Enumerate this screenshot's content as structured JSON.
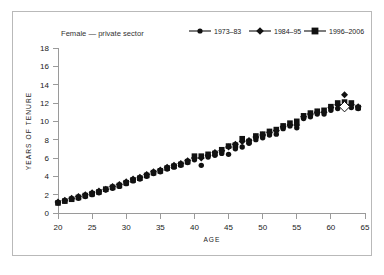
{
  "figure": {
    "series_title": "Female — private sector",
    "background": "#ffffff",
    "frame_color": "#b9b9b9",
    "ink_color": "#111111"
  },
  "legend": {
    "position": "top-right",
    "entries": [
      {
        "label": "1973–83",
        "marker": "circle-marker",
        "color": "#111111"
      },
      {
        "label": "1984–95",
        "marker": "diamond-marker",
        "color": "#111111"
      },
      {
        "label": "1996–2006",
        "marker": "square-marker",
        "color": "#111111"
      }
    ]
  },
  "chart_data": {
    "type": "scatter",
    "title": "Female — private sector",
    "xlabel": "AGE",
    "ylabel": "YEARS OF TENURE",
    "xlim": [
      20,
      65
    ],
    "ylim": [
      0,
      18
    ],
    "xticks": [
      20,
      25,
      30,
      35,
      40,
      45,
      50,
      55,
      60,
      65
    ],
    "yticks": [
      0,
      2,
      4,
      6,
      8,
      10,
      12,
      14,
      16,
      18
    ],
    "grid": false,
    "legend_position": "top-right",
    "x": [
      20,
      21,
      22,
      23,
      24,
      25,
      26,
      27,
      28,
      29,
      30,
      31,
      32,
      33,
      34,
      35,
      36,
      37,
      38,
      39,
      40,
      41,
      42,
      43,
      44,
      45,
      46,
      47,
      48,
      49,
      50,
      51,
      52,
      53,
      54,
      55,
      56,
      57,
      58,
      59,
      60,
      61,
      62,
      63,
      64
    ],
    "series": [
      {
        "name": "1973–83",
        "marker": "circle-marker",
        "values": [
          1.1,
          1.3,
          1.5,
          1.6,
          1.8,
          2.0,
          2.2,
          2.5,
          2.7,
          2.9,
          3.2,
          3.5,
          3.7,
          4.0,
          4.3,
          4.5,
          4.8,
          5.0,
          5.2,
          5.5,
          5.8,
          5.2,
          6.1,
          6.3,
          6.5,
          6.4,
          7.0,
          7.2,
          7.6,
          8.0,
          8.2,
          8.5,
          8.6,
          9.2,
          9.5,
          9.3,
          10.3,
          10.5,
          10.8,
          10.8,
          11.2,
          11.4,
          11.6,
          11.5,
          11.4
        ]
      },
      {
        "name": "1984–95",
        "marker": "diamond-marker",
        "values": [
          1.2,
          1.4,
          1.6,
          1.8,
          2.0,
          2.2,
          2.4,
          2.6,
          2.9,
          3.1,
          3.4,
          3.7,
          3.9,
          4.2,
          4.5,
          4.7,
          5.0,
          5.2,
          5.4,
          5.7,
          6.0,
          6.0,
          6.3,
          6.6,
          6.8,
          7.2,
          7.5,
          7.8,
          7.9,
          8.3,
          8.5,
          8.8,
          9.0,
          9.4,
          9.6,
          9.6,
          10.5,
          10.8,
          11.0,
          11.0,
          11.5,
          11.8,
          12.9,
          11.8,
          11.6
        ]
      },
      {
        "name": "1996–2006",
        "marker": "square-marker",
        "values": [
          1.1,
          1.3,
          1.5,
          1.7,
          1.9,
          2.1,
          2.3,
          2.6,
          2.8,
          3.0,
          3.3,
          3.6,
          3.8,
          4.1,
          4.4,
          4.6,
          4.9,
          5.1,
          5.3,
          5.6,
          6.2,
          6.2,
          6.4,
          6.5,
          6.9,
          7.3,
          7.4,
          8.1,
          7.8,
          8.4,
          8.6,
          8.9,
          9.1,
          9.5,
          9.8,
          10.0,
          10.6,
          10.9,
          11.1,
          11.2,
          11.6,
          12.0,
          12.1,
          12.0,
          11.5
        ]
      }
    ],
    "annotations": [
      {
        "type": "open-diamond-marker",
        "x": 62,
        "y": 11.6
      }
    ]
  }
}
